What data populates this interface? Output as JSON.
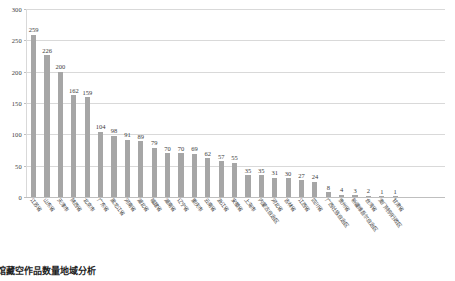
{
  "caption": "馆藏空作品数量地域分析",
  "chart_data": {
    "type": "bar",
    "title": "",
    "subtitle": "",
    "xlabel": "",
    "ylabel": "",
    "ylim": [
      0,
      300
    ],
    "yticks": [
      0,
      50,
      100,
      150,
      200,
      250,
      300
    ],
    "ytick_labels": [
      "0",
      "50",
      "100",
      "150",
      "200",
      "250",
      "300"
    ],
    "grid": true,
    "legend": "none",
    "bar_color": "#a6a6a6",
    "gridline_color": "#d9d9d9",
    "label_color": "#3b3b3b",
    "categories": [
      "江苏省",
      "山东省",
      "天津市",
      "陕西省",
      "北京市",
      "广东省",
      "黑龙江省",
      "河南省",
      "湖北省",
      "福建省",
      "湖南省",
      "辽宁省",
      "重庆市",
      "云南省",
      "浙江省",
      "安徽省",
      "上海市",
      "内蒙古自治区",
      "河北省",
      "吉林省",
      "江西省",
      "四川省",
      "广西壮族自治区",
      "贵州省",
      "新疆维吾尔自治区",
      "台湾省",
      "澳门特别行政区",
      "甘肃省"
    ],
    "values": [
      259,
      226,
      200,
      162,
      159,
      104,
      98,
      91,
      89,
      79,
      70,
      70,
      69,
      62,
      57,
      55,
      35,
      35,
      31,
      30,
      27,
      24,
      8,
      4,
      3,
      2,
      1,
      1
    ]
  }
}
